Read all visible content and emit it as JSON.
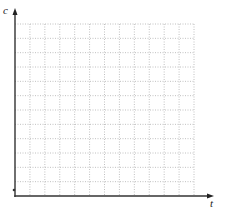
{
  "figure": {
    "type": "blank-grid-axes",
    "y_axis_label": "c",
    "x_axis_label": "t",
    "grid": {
      "columns": 12,
      "rows": 12,
      "style": "dotted",
      "color": "#b0b0b0"
    },
    "axis_color": "#333333"
  }
}
